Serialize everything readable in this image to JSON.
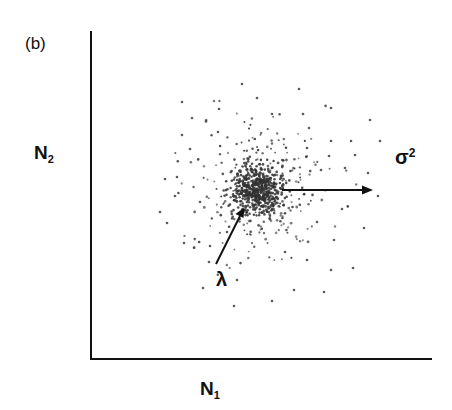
{
  "panel": {
    "label": "(b)"
  },
  "axes": {
    "x_label_main": "N",
    "x_label_sub": "1",
    "y_label_main": "N",
    "y_label_sub": "2"
  },
  "annotations": {
    "sigma_main": "σ",
    "sigma_sup": "2",
    "lambda": "λ"
  },
  "colors": {
    "axis": "#111111",
    "points": "#333333",
    "arrow": "#111111"
  },
  "chart_data": {
    "type": "scatter",
    "title": "(b)",
    "xlabel": "N₁",
    "ylabel": "N₂",
    "grid": false,
    "ticks": "none",
    "cluster_center_px": [
      258,
      190
    ],
    "annotations": [
      {
        "text": "λ",
        "meaning": "mean / center of cluster",
        "arrow_from_px": [
          216,
          264
        ],
        "arrow_to_px": [
          244,
          209
        ]
      },
      {
        "text": "σ²",
        "meaning": "variance / spread",
        "arrow_from_px": [
          282,
          190
        ],
        "arrow_to_px": [
          372,
          190
        ]
      }
    ],
    "generator": {
      "seed": 7,
      "n_dense": 520,
      "core_sd_px": 14,
      "mid_sd_px": 34,
      "n_mid": 260
    },
    "outer_points_px": [
      [
        182,
        102
      ],
      [
        192,
        118
      ],
      [
        219,
        109
      ],
      [
        242,
        84
      ],
      [
        257,
        98
      ],
      [
        272,
        114
      ],
      [
        182,
        135
      ],
      [
        218,
        132
      ],
      [
        190,
        149
      ],
      [
        177,
        177
      ],
      [
        299,
        89
      ],
      [
        331,
        108
      ],
      [
        303,
        114
      ],
      [
        370,
        120
      ],
      [
        309,
        128
      ],
      [
        380,
        141
      ],
      [
        331,
        141
      ],
      [
        351,
        141
      ],
      [
        307,
        148
      ],
      [
        329,
        156
      ],
      [
        355,
        155
      ],
      [
        321,
        170
      ],
      [
        345,
        168
      ],
      [
        368,
        173
      ],
      [
        175,
        196
      ],
      [
        167,
        223
      ],
      [
        184,
        243
      ],
      [
        210,
        246
      ],
      [
        203,
        288
      ],
      [
        237,
        280
      ],
      [
        234,
        306
      ],
      [
        209,
        262
      ],
      [
        378,
        196
      ],
      [
        342,
        209
      ],
      [
        317,
        222
      ],
      [
        364,
        228
      ],
      [
        334,
        240
      ],
      [
        285,
        252
      ],
      [
        307,
        260
      ],
      [
        331,
        270
      ],
      [
        353,
        268
      ],
      [
        294,
        290
      ],
      [
        324,
        292
      ],
      [
        272,
        301
      ],
      [
        165,
        179
      ],
      [
        200,
        202
      ],
      [
        160,
        212
      ],
      [
        227,
        232
      ]
    ]
  }
}
